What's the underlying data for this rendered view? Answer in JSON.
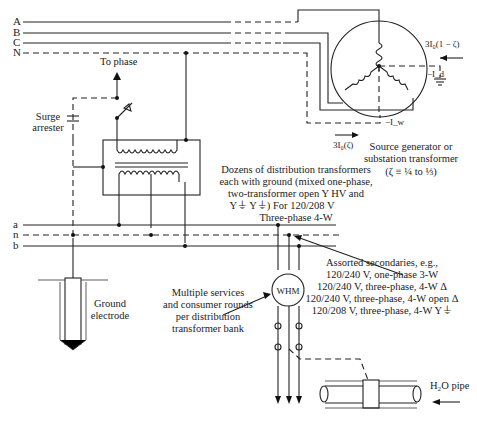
{
  "diagram": {
    "primary_buses": [
      "A",
      "B",
      "C",
      "N"
    ],
    "secondary_buses": [
      "a",
      "n",
      "b"
    ],
    "labels": {
      "to_phase": "To phase",
      "surge_arrester_1": "Surge",
      "surge_arrester_2": "arrester",
      "dozens_1": "Dozens of distribution transformers",
      "dozens_2": "each with ground (mixed one-phase,",
      "dozens_3": "two-transformer open Y HV and",
      "dozens_4": "Y⏚ Y⏚) For 120/208 V",
      "dozens_5": "Three-phase 4-W",
      "source_1": "Source generator or",
      "source_2": "substation transformer",
      "source_3": "(ζ ≡ ¼ to ⅓)",
      "current_top": "3I₀(1 − ζ)",
      "current_bottom": "3I₀(ζ)",
      "minus_id": "−I_d",
      "minus_iw": "−I_w",
      "ground_electrode_1": "Ground",
      "ground_electrode_2": "electrode",
      "multiple_1": "Multiple services",
      "multiple_2": "and consumer rounds",
      "multiple_3": "per distribution",
      "multiple_4": "transformer bank",
      "assorted_1": "Assorted secondaries, e.g.,",
      "assorted_2": "120/240 V, one-phase 3-W",
      "assorted_3": "120/240 V, three-phase, 4-W Δ",
      "assorted_4": "120/240 V, three-phase, 4-W open Δ",
      "assorted_5": "120/208 V, three-phase, 4-W Y⏚",
      "whm": "WHM",
      "water_pipe": "H₂O pipe"
    }
  }
}
